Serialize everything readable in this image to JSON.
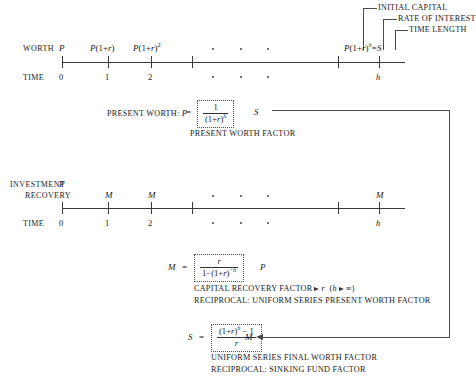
{
  "callouts": [
    {
      "label": "INITIAL CAPITAL"
    },
    {
      "label": "RATE OF INTEREST"
    },
    {
      "label": "TIME LENGTH"
    }
  ],
  "worth_timeline": {
    "row_label": "WORTH",
    "time_label": "TIME",
    "worth_values": [
      "P",
      "P(1+r)",
      "P(1+r)2",
      "P(1+r)h=S"
    ],
    "time_values": [
      "0",
      "1",
      "2",
      "h"
    ],
    "ellipsis": "•   •   •"
  },
  "present_worth": {
    "prefix": "PRESENT WORTH:",
    "lhs": "P",
    "equals": "=",
    "numerator": "1",
    "denominator": "(1+r)h",
    "multiplier": "S",
    "caption": "PRESENT WORTH FACTOR"
  },
  "investment_timeline": {
    "row_label_line1": "INVESTMENT",
    "row_label_line2": "RECOVERY",
    "initial": "P",
    "time_label": "TIME",
    "payments": [
      "M",
      "M",
      "M"
    ],
    "time_values": [
      "0",
      "1",
      "2",
      "h"
    ],
    "ellipsis": "•   •   •"
  },
  "capital_recovery": {
    "lhs": "M",
    "equals": "=",
    "numerator": "r",
    "denominator": "1−(1+r)−h",
    "multiplier": "P",
    "caption_line1_a": "CAPITAL RECOVERY FACTOR",
    "caption_line1_b": "r",
    "caption_line1_c": "(h",
    "caption_line1_d": "∞)",
    "caption_line2": "RECIPROCAL: UNIFORM SERIES PRESENT WORTH FACTOR"
  },
  "final_worth": {
    "lhs": "S",
    "equals": "=",
    "numerator": "(1+r)h − 1",
    "denominator": "r",
    "multiplier": "M",
    "caption_line1": "UNIFORM SERIES FINAL WORTH FACTOR",
    "caption_line2": "RECIPROCAL: SINKING FUND FACTOR"
  },
  "colors": {
    "ink": "#1a1a1a",
    "rule": "#3a3a3a",
    "connector": "#4a4a4a"
  }
}
